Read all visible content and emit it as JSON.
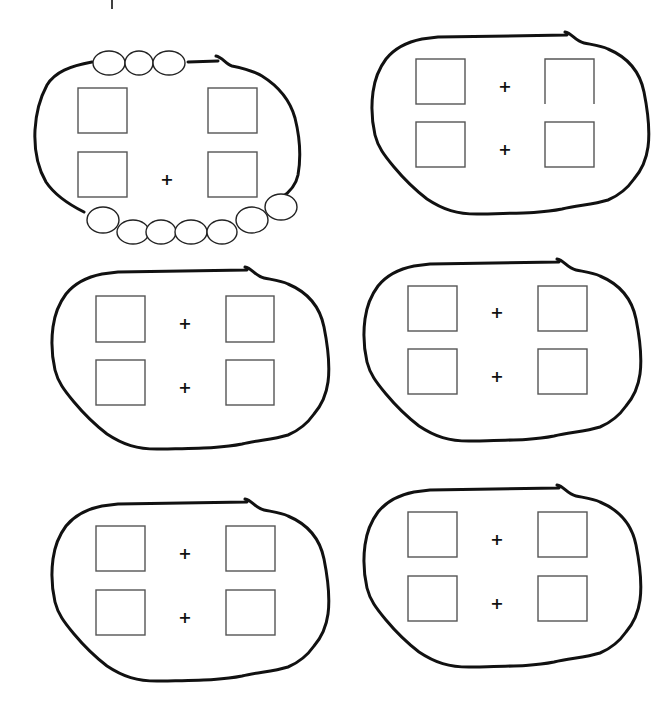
{
  "worksheet": {
    "top_mark": "|",
    "plus_symbol": "+",
    "colors": {
      "background": "#ffffff",
      "outline": "#111111",
      "box": "#555555"
    },
    "groups": [
      {
        "id": "group-1",
        "has_beads": true,
        "top_beads": 3,
        "bottom_beads": 8,
        "plus_signs": 1,
        "boxes": 4
      },
      {
        "id": "group-2",
        "has_beads": false,
        "plus_signs": 2,
        "boxes": 4,
        "note": "top-right box missing bottom edge"
      },
      {
        "id": "group-3",
        "has_beads": false,
        "plus_signs": 2,
        "boxes": 4
      },
      {
        "id": "group-4",
        "has_beads": false,
        "plus_signs": 2,
        "boxes": 4
      },
      {
        "id": "group-5",
        "has_beads": false,
        "plus_signs": 2,
        "boxes": 4
      },
      {
        "id": "group-6",
        "has_beads": false,
        "plus_signs": 2,
        "boxes": 4
      }
    ]
  }
}
